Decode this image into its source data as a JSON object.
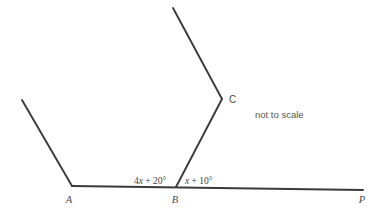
{
  "figure": {
    "type": "geometry-diagram",
    "background_color": "#ffffff",
    "line_color": "#3a3a3a",
    "text_color": "#4a4a4a",
    "annotation": "not to scale",
    "vertices": {
      "A": {
        "label": "A",
        "x": 72,
        "y": 186
      },
      "B": {
        "label": "B",
        "x": 176,
        "y": 187
      },
      "C": {
        "label": "C",
        "x": 222,
        "y": 99
      },
      "P": {
        "label": "P",
        "x": 363,
        "y": 190
      }
    },
    "angles": {
      "ABC": {
        "label_prefix": "4",
        "label_var": "x",
        "label_suffix": " + 20°",
        "full": "4x + 20°"
      },
      "CBP": {
        "label_prefix": "",
        "label_var": "x",
        "label_suffix": " + 10°",
        "full": "x + 10°"
      }
    },
    "segments": [
      {
        "name": "ray-from-A-upper-left",
        "x1": 22,
        "y1": 100,
        "x2": 72,
        "y2": 186
      },
      {
        "name": "segment-A-to-P-baseline",
        "x1": 72,
        "y1": 186,
        "x2": 363,
        "y2": 190
      },
      {
        "name": "segment-B-to-C",
        "x1": 176,
        "y1": 187,
        "x2": 222,
        "y2": 99
      },
      {
        "name": "ray-from-C-upper-left",
        "x1": 222,
        "y1": 99,
        "x2": 173,
        "y2": 8
      }
    ]
  }
}
